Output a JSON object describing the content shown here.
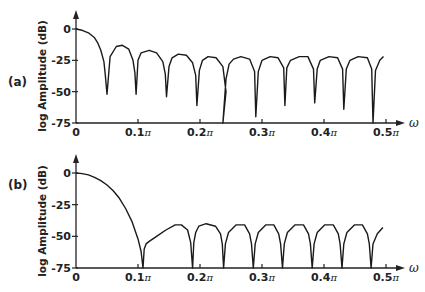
{
  "chart_data": [
    {
      "type": "line",
      "panel_label": "(a)",
      "title": "",
      "xlabel": "ω",
      "ylabel": "log Amplitude (dB)",
      "xlim": [
        0,
        0.52
      ],
      "ylim": [
        -75,
        0
      ],
      "x_unit": "π",
      "x_ticks": [
        0,
        0.1,
        0.2,
        0.3,
        0.4,
        0.5
      ],
      "x_tick_labels": [
        "0",
        "0.1π",
        "0.2π",
        "0.3π",
        "0.4π",
        "0.5π"
      ],
      "y_ticks": [
        0,
        -25,
        -50,
        -75
      ],
      "y_tick_labels": [
        "0",
        "-25",
        "-50",
        "-75"
      ],
      "grid": false,
      "legend": null,
      "series": [
        {
          "name": "response (a)",
          "x": [
            0,
            0.01,
            0.02,
            0.03,
            0.035,
            0.04,
            0.045,
            0.047,
            0.05,
            0.055,
            0.065,
            0.075,
            0.085,
            0.092,
            0.095,
            0.097,
            0.1,
            0.105,
            0.118,
            0.13,
            0.14,
            0.144,
            0.146,
            0.15,
            0.155,
            0.165,
            0.178,
            0.188,
            0.193,
            0.195,
            0.199,
            0.204,
            0.213,
            0.226,
            0.237,
            0.242,
            0.237,
            0.242,
            0.247,
            0.254,
            0.266,
            0.28,
            0.288,
            0.29,
            0.294,
            0.3,
            0.313,
            0.326,
            0.335,
            0.337,
            0.34,
            0.346,
            0.36,
            0.374,
            0.383,
            0.385,
            0.389,
            0.394,
            0.408,
            0.422,
            0.43,
            0.432,
            0.436,
            0.442,
            0.455,
            0.47,
            0.477,
            0.479,
            0.483,
            0.49,
            0.496
          ],
          "y": [
            0,
            -1,
            -3,
            -7,
            -11,
            -17,
            -26,
            -35,
            -52,
            -22,
            -14,
            -13,
            -16,
            -25,
            -35,
            -52,
            -25,
            -19,
            -17,
            -19,
            -26,
            -36,
            -54,
            -30,
            -23,
            -20,
            -21,
            -27,
            -37,
            -61,
            -33,
            -25,
            -22,
            -23,
            -30,
            -50,
            -75,
            -40,
            -28,
            -24,
            -22,
            -24,
            -34,
            -70,
            -34,
            -25,
            -22,
            -23,
            -31,
            -61,
            -31,
            -25,
            -22,
            -22,
            -32,
            -59,
            -32,
            -25,
            -22,
            -23,
            -32,
            -64,
            -32,
            -25,
            -22,
            -23,
            -32,
            -75,
            -33,
            -25,
            -22
          ]
        }
      ]
    },
    {
      "type": "line",
      "panel_label": "(b)",
      "title": "",
      "xlabel": "ω",
      "ylabel": "log Amplitude (dB)",
      "xlim": [
        0,
        0.52
      ],
      "ylim": [
        -75,
        0
      ],
      "x_unit": "π",
      "x_ticks": [
        0,
        0.1,
        0.2,
        0.3,
        0.4,
        0.5
      ],
      "x_tick_labels": [
        "0",
        "0.1π",
        "0.2π",
        "0.3π",
        "0.4π",
        "0.5π"
      ],
      "y_ticks": [
        0,
        -25,
        -50,
        -75
      ],
      "y_tick_labels": [
        "0",
        "-25",
        "-50",
        "-75"
      ],
      "grid": false,
      "legend": null,
      "series": [
        {
          "name": "response (b)",
          "x": [
            0,
            0.01,
            0.02,
            0.03,
            0.04,
            0.05,
            0.06,
            0.07,
            0.08,
            0.09,
            0.1,
            0.105,
            0.108,
            0.11,
            0.113,
            0.118,
            0.13,
            0.145,
            0.16,
            0.17,
            0.18,
            0.185,
            0.188,
            0.19,
            0.193,
            0.198,
            0.21,
            0.225,
            0.233,
            0.236,
            0.238,
            0.241,
            0.246,
            0.258,
            0.272,
            0.28,
            0.283,
            0.286,
            0.289,
            0.294,
            0.306,
            0.319,
            0.327,
            0.33,
            0.333,
            0.336,
            0.341,
            0.353,
            0.367,
            0.375,
            0.378,
            0.381,
            0.384,
            0.389,
            0.401,
            0.415,
            0.423,
            0.426,
            0.429,
            0.432,
            0.437,
            0.449,
            0.462,
            0.47,
            0.473,
            0.476,
            0.479,
            0.486,
            0.495
          ],
          "y": [
            0,
            -0.5,
            -1.5,
            -3.5,
            -6,
            -9.5,
            -14,
            -20,
            -28,
            -38,
            -52,
            -62,
            -75,
            -60,
            -56,
            -54,
            -50,
            -45,
            -41,
            -41,
            -45,
            -55,
            -75,
            -55,
            -47,
            -42,
            -40,
            -42,
            -48,
            -56,
            -75,
            -56,
            -47,
            -41,
            -41,
            -48,
            -56,
            -75,
            -56,
            -47,
            -41,
            -41,
            -48,
            -56,
            -75,
            -56,
            -47,
            -41,
            -41,
            -48,
            -56,
            -75,
            -56,
            -47,
            -41,
            -41,
            -48,
            -56,
            -75,
            -56,
            -47,
            -41,
            -41,
            -48,
            -56,
            -75,
            -56,
            -48,
            -43
          ]
        }
      ]
    }
  ]
}
